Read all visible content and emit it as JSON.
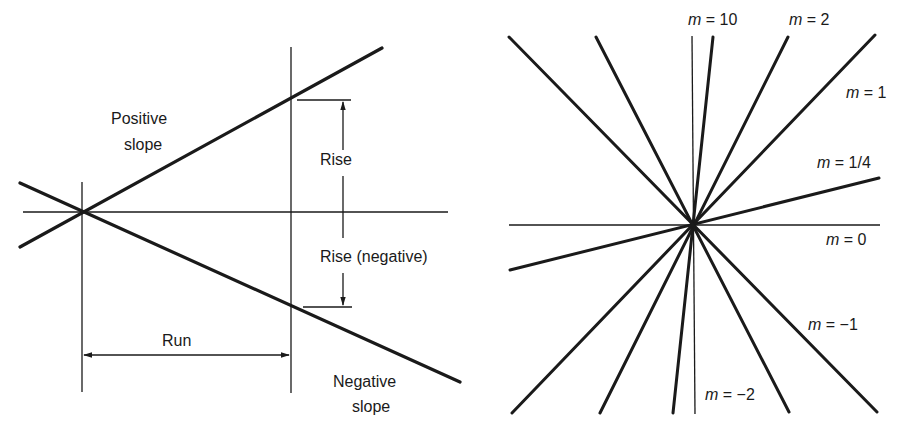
{
  "left_panel": {
    "title": "Slope: rise over run",
    "labels": {
      "positive_slope_line1": "Positive",
      "positive_slope_line2": "slope",
      "rise": "Rise",
      "rise_negative": "Rise (negative)",
      "run": "Run",
      "negative_slope_line1": "Negative",
      "negative_slope_line2": "slope"
    }
  },
  "right_panel": {
    "title": "Lines of various slopes through a common point",
    "var": "m",
    "labels": [
      {
        "id": "m10",
        "value": " = 10"
      },
      {
        "id": "m2",
        "value": " = 2"
      },
      {
        "id": "m1",
        "value": " = 1"
      },
      {
        "id": "m14",
        "value": " = 1/4"
      },
      {
        "id": "m0",
        "value": " = 0"
      },
      {
        "id": "mneg1",
        "value": " = −1"
      },
      {
        "id": "mneg2",
        "value": " = −2"
      }
    ]
  },
  "colors": {
    "ink": "#1a1a1a",
    "background": "#ffffff"
  }
}
